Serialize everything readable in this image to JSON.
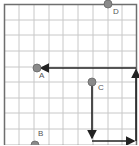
{
  "grid": {
    "cols": 9,
    "rows": 9,
    "line_color": "#c8c8c8",
    "border_color": "#6e6e6e"
  },
  "points": [
    {
      "id": "A",
      "label": "A",
      "x": 37,
      "y": 68,
      "lx": 39,
      "ly": 74
    },
    {
      "id": "B",
      "label": "B",
      "x": 35,
      "y": 145,
      "lx": 38,
      "ly": 133
    },
    {
      "id": "C",
      "label": "C",
      "x": 92,
      "y": 82,
      "lx": 99,
      "ly": 86
    },
    {
      "id": "D",
      "label": "D",
      "x": 108,
      "y": 4,
      "lx": 112,
      "ly": 9
    }
  ],
  "point_color": "#8a8a8a",
  "arrow_color": "#222222",
  "arrows": [
    {
      "from": "right-bottom",
      "path": "up then left to A"
    },
    {
      "from": "C",
      "path": "down then right"
    }
  ]
}
